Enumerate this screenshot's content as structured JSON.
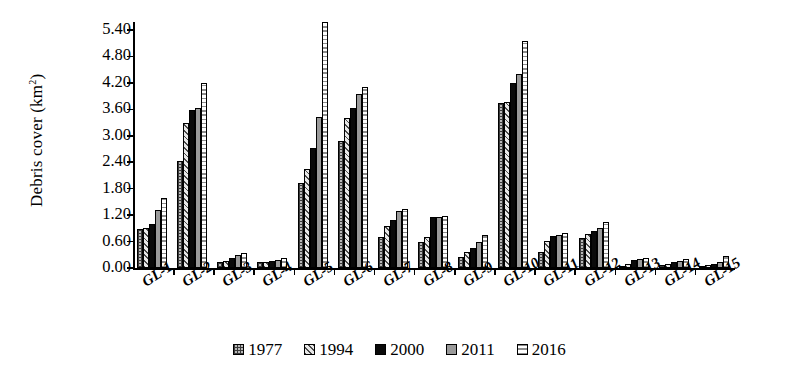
{
  "chart_data": {
    "type": "bar",
    "title": "",
    "xlabel": "",
    "ylabel": "Debris cover (km²)",
    "ylabel_base": "Debris cover (km",
    "ylabel_sup": "2",
    "ylabel_close": ")",
    "ylim": [
      0.0,
      5.4
    ],
    "ytick_step": 0.6,
    "ytick_labels": [
      "0.00",
      "0.60",
      "1.20",
      "1.80",
      "2.40",
      "3.00",
      "3.60",
      "4.20",
      "4.80",
      "5.40"
    ],
    "ytick_values": [
      0.0,
      0.6,
      1.2,
      1.8,
      2.4,
      3.0,
      3.6,
      4.2,
      4.8,
      5.4
    ],
    "grid": false,
    "legend_position": "bottom",
    "categories": [
      "GL-1",
      "GL-2",
      "GL-3",
      "GL-4",
      "GL-5",
      "GL-6",
      "GL-7",
      "GL-8",
      "GL-9",
      "GL-10",
      "GL-11",
      "GL-12",
      "GL-13",
      "GL-14",
      "GL-15"
    ],
    "series": [
      {
        "name": "1977",
        "pattern": "crosshatch",
        "values": [
          0.88,
          2.42,
          0.14,
          0.13,
          1.92,
          2.88,
          0.7,
          0.58,
          0.25,
          3.75,
          0.37,
          0.68,
          0.03,
          0.06,
          0.05
        ]
      },
      {
        "name": "1994",
        "pattern": "diagonal-hatch",
        "values": [
          0.91,
          3.3,
          0.17,
          0.14,
          2.25,
          3.4,
          0.95,
          0.7,
          0.36,
          3.76,
          0.62,
          0.78,
          0.1,
          0.09,
          0.07
        ]
      },
      {
        "name": "2000",
        "pattern": "solid-black",
        "values": [
          1.0,
          3.58,
          0.22,
          0.16,
          2.72,
          3.62,
          1.1,
          1.15,
          0.45,
          4.2,
          0.72,
          0.85,
          0.18,
          0.14,
          0.1
        ]
      },
      {
        "name": "2011",
        "pattern": "solid-grey",
        "values": [
          1.32,
          3.63,
          0.3,
          0.18,
          3.42,
          3.95,
          1.3,
          1.15,
          0.6,
          4.4,
          0.75,
          0.9,
          0.2,
          0.16,
          0.13
        ]
      },
      {
        "name": "2016",
        "pattern": "dotted",
        "values": [
          1.58,
          4.19,
          0.35,
          0.22,
          5.58,
          4.1,
          1.35,
          1.18,
          0.74,
          5.15,
          0.8,
          1.05,
          0.22,
          0.2,
          0.28
        ]
      }
    ]
  },
  "legend": {
    "items": [
      {
        "label": "1977",
        "swatch": "crosshatch"
      },
      {
        "label": "1994",
        "swatch": "diagonal-hatch"
      },
      {
        "label": "2000",
        "swatch": "solid-black"
      },
      {
        "label": "2011",
        "swatch": "solid-grey"
      },
      {
        "label": "2016",
        "swatch": "dotted"
      }
    ]
  }
}
